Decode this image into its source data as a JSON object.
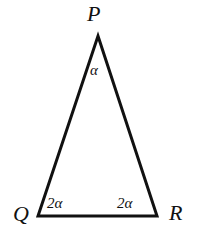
{
  "figure": {
    "type": "geometry-diagram",
    "shape": "triangle",
    "background_color": "#ffffff",
    "stroke_color": "#111111",
    "stroke_width_px": 3
  },
  "vertices": {
    "apex": {
      "name": "P",
      "label": "P",
      "x": 98,
      "y": 36
    },
    "bottom_left": {
      "name": "Q",
      "label": "Q",
      "x": 38,
      "y": 216
    },
    "bottom_right": {
      "name": "R",
      "label": "R",
      "x": 157,
      "y": 216
    }
  },
  "angles": {
    "apex": {
      "label": "α",
      "at_vertex": "P"
    },
    "bottom_left": {
      "label": "2α",
      "at_vertex": "Q"
    },
    "bottom_right": {
      "label": "2α",
      "at_vertex": "R"
    }
  }
}
